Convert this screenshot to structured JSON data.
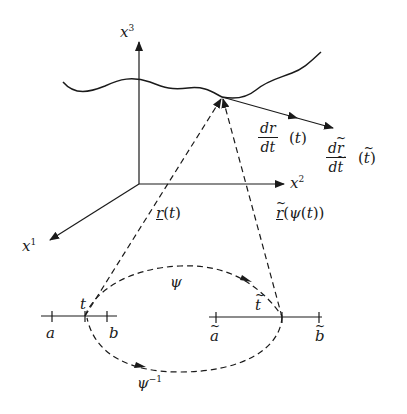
{
  "diagram": {
    "axes": {
      "x1": {
        "label": "x",
        "superscript": "1"
      },
      "x2": {
        "label": "x",
        "superscript": "2"
      },
      "x3": {
        "label": "x",
        "superscript": "3"
      }
    },
    "vectors": {
      "r_t": "r(t)",
      "r_tilde": "r̃(ψ(t))",
      "r_t_base": "r",
      "r_t_arg": "(t)",
      "r_tilde_base": "r",
      "r_tilde_arg": "(ψ(t))"
    },
    "derivatives": {
      "d1": {
        "numerator": "dr",
        "denominator": "dt",
        "argument": "(t)"
      },
      "d2": {
        "numerator": "dr",
        "denominator": "dt",
        "argument": "(t)",
        "tilde": "~"
      }
    },
    "maps": {
      "psi": "ψ",
      "psi_inverse": "ψ",
      "psi_inverse_sup": "−1"
    },
    "intervals": {
      "left": {
        "start": "a",
        "point": "t",
        "end": "b"
      },
      "right": {
        "start": "a",
        "point": "t",
        "end": "b",
        "tilde": "~"
      }
    },
    "colors": {
      "stroke": "#1a1a1a",
      "background": "#ffffff"
    }
  }
}
